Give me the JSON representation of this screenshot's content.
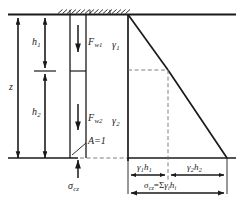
{
  "figure": {
    "type": "engineering-diagram",
    "colors": {
      "line": "#1a1a1a",
      "dashed": "#8a8a8a",
      "background": "#ffffff",
      "text": "#1a1a1a"
    }
  },
  "depth_scale": {
    "total_label": "z",
    "layer1_label": "h",
    "layer1_sub": "1",
    "layer2_label": "h",
    "layer2_sub": "2"
  },
  "soil_column": {
    "layer1": {
      "force_label": "F",
      "force_sub": "w1",
      "unit_weight_label": "γ",
      "unit_weight_sub": "1"
    },
    "layer2": {
      "force_label": "F",
      "force_sub": "w2",
      "unit_weight_label": "γ",
      "unit_weight_sub": "2"
    },
    "area_label": "A=1",
    "base_stress_label": "σ",
    "base_stress_sub": "cz"
  },
  "stress_diagram": {
    "segment1_label": "γ",
    "segment1_sub": "1",
    "segment1_label2": "h",
    "segment1_sub2": "1",
    "segment2_label": "γ",
    "segment2_sub": "2",
    "segment2_label2": "h",
    "segment2_sub2": "2",
    "total_label": "σ",
    "total_sub": "cz",
    "total_equals": "=Σ",
    "total_gamma": "γ",
    "total_gamma_sub": "i",
    "total_h": "h",
    "total_h_sub": "i"
  }
}
